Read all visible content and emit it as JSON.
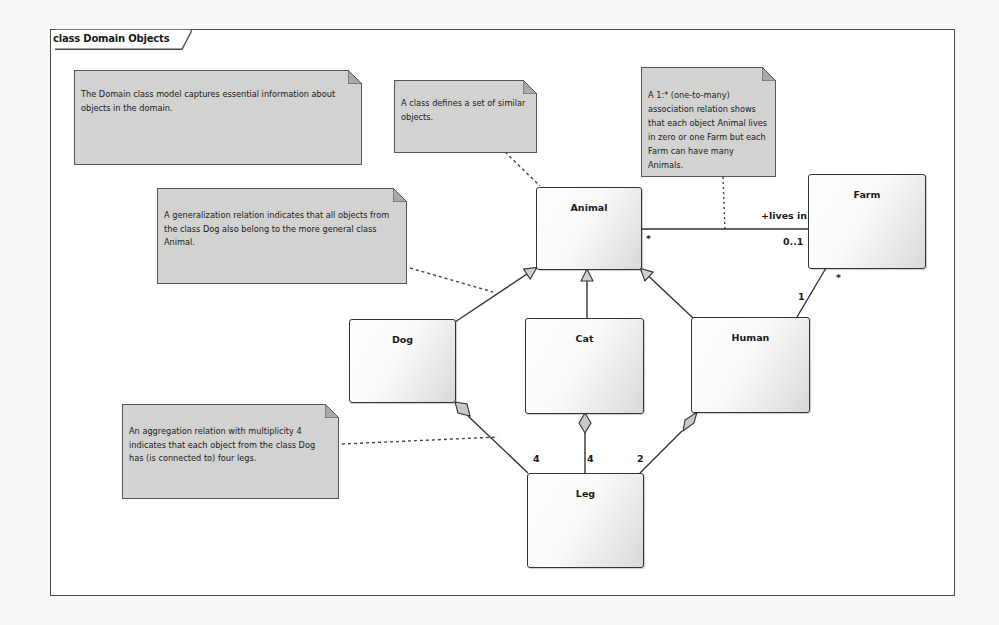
{
  "diagram": {
    "frame_title": "class Domain Objects",
    "notes": [
      {
        "id": "note-domain-model",
        "text": "The Domain class model captures essential information about objects in the domain."
      },
      {
        "id": "note-class-definition",
        "text": "A class defines a set of similar objects."
      },
      {
        "id": "note-association",
        "text": "A 1:* (one-to-many) association relation shows that each object Animal lives in zero or one Farm but each Farm can have many Animals."
      },
      {
        "id": "note-generalization",
        "text": "A generalization relation  indicates that all objects from the class Dog also belong to the more general class Animal."
      },
      {
        "id": "note-aggregation",
        "text": "An aggregation relation with multiplicity 4 indicates that each object from the class Dog has (is connected to) four legs."
      }
    ],
    "classes": [
      {
        "id": "animal",
        "name": "Animal"
      },
      {
        "id": "farm",
        "name": "Farm"
      },
      {
        "id": "dog",
        "name": "Dog"
      },
      {
        "id": "cat",
        "name": "Cat"
      },
      {
        "id": "human",
        "name": "Human"
      },
      {
        "id": "leg",
        "name": "Leg"
      }
    ],
    "relations": {
      "association": {
        "role": "+lives in",
        "animal_multiplicity": "*",
        "farm_multiplicity": "0..1"
      },
      "human_farm": {
        "human_end": "1",
        "farm_end": "*"
      },
      "aggregations": [
        {
          "from": "Dog",
          "to": "Leg",
          "multiplicity": "4"
        },
        {
          "from": "Cat",
          "to": "Leg",
          "multiplicity": "4"
        },
        {
          "from": "Human",
          "to": "Leg",
          "multiplicity": "2"
        }
      ],
      "generalizations": [
        {
          "child": "Dog",
          "parent": "Animal"
        },
        {
          "child": "Cat",
          "parent": "Animal"
        },
        {
          "child": "Human",
          "parent": "Animal"
        }
      ]
    },
    "colors": {
      "note_fill": "#d2d2d0",
      "border": "#333333",
      "frame_border": "#4a4a4a"
    }
  }
}
